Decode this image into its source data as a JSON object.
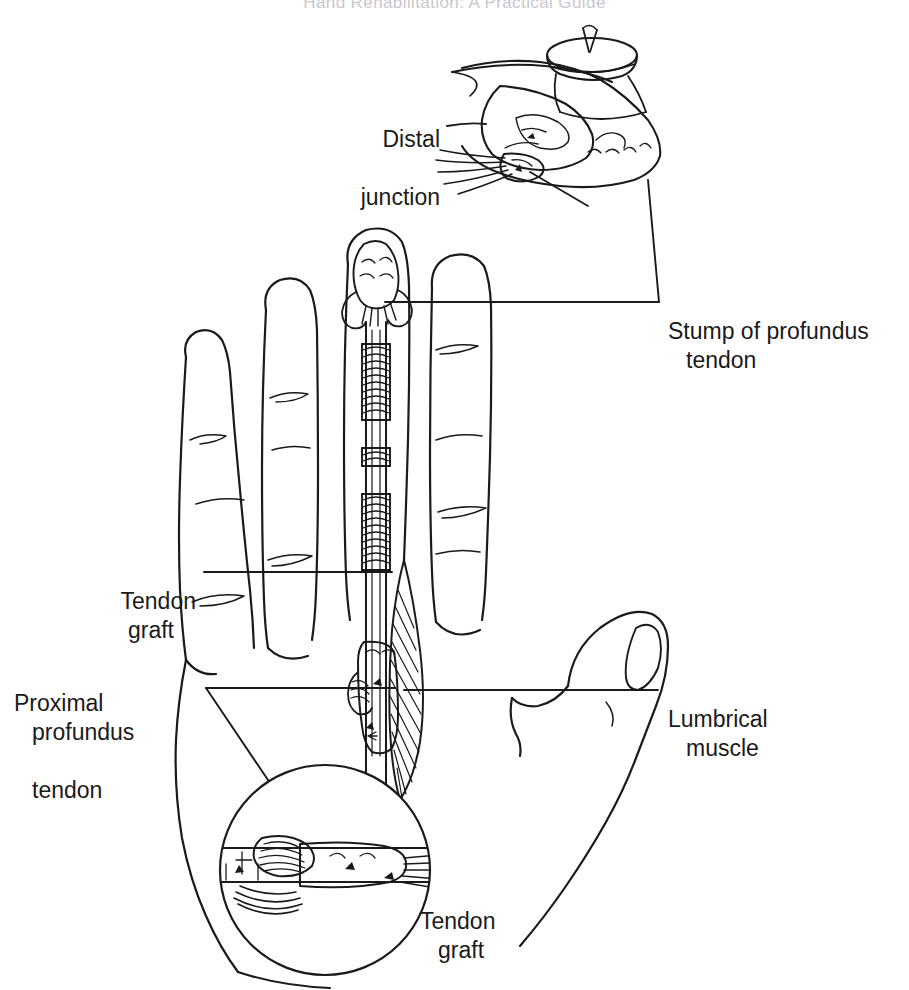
{
  "page": {
    "running_head": "Hand Rehabilitation: A Practical Guide",
    "width": 909,
    "height": 990,
    "background": "#ffffff",
    "ink_color": "#1a1a1a",
    "running_head_color": "#c8c8cf"
  },
  "labels": {
    "distal_junction": {
      "line1": "Distal",
      "line2": "junction"
    },
    "stump_of_profundus_tendon": {
      "line1": "Stump of profundus",
      "line2": "tendon"
    },
    "tendon_graft_upper": {
      "line1": "Tendon",
      "line2": "graft"
    },
    "proximal_profundus_tendon": {
      "line1": "Proximal",
      "line2": "profundus",
      "line3": "tendon"
    },
    "lumbrical_muscle": {
      "line1": "Lumbrical",
      "line2": "muscle"
    },
    "tendon_graft_lower": {
      "line1": "Tendon",
      "line2": "graft"
    }
  },
  "insets": {
    "distal_inset": {
      "name": "distal-junction-inset",
      "description": "fingertip with nail and profundus stump attachment"
    },
    "proximal_inset": {
      "name": "proximal-junction-inset",
      "description": "circular magnified view of the weave suture junction"
    }
  },
  "anatomy": {
    "digits": [
      "little finger",
      "ring finger",
      "middle finger",
      "index finger",
      "thumb"
    ],
    "graft_digit": "middle finger"
  }
}
